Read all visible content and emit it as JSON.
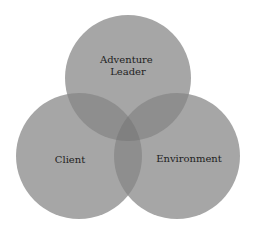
{
  "diagram": {
    "type": "venn",
    "sets": [
      {
        "id": "adventure-leader",
        "label_lines": [
          "Adventure",
          "Leader"
        ],
        "cx": 128,
        "cy": 78,
        "r": 63
      },
      {
        "id": "client",
        "label_lines": [
          "Client"
        ],
        "cx": 79,
        "cy": 156,
        "r": 63
      },
      {
        "id": "environment",
        "label_lines": [
          "Environment"
        ],
        "cx": 177,
        "cy": 156,
        "r": 63
      }
    ],
    "colors": {
      "single": "#a6a6a6",
      "double": "#8e8e8e",
      "triple": "#808080",
      "text": "#1e1e1e",
      "background": "#ffffff"
    }
  }
}
